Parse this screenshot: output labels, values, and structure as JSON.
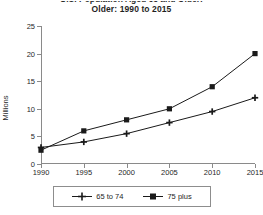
{
  "chart": {
    "title_line1": "U.S. Population Aged 65 and Older:",
    "title_line2": "Older:  1990 to 2015",
    "ylabel": "Millions",
    "xlabel": ""
  },
  "legend": {
    "items": [
      {
        "label": "65 to 74",
        "marker": "plus-marker",
        "color": "#1a1a1a"
      },
      {
        "label": "75 plus",
        "marker": "square-marker",
        "color": "#1a1a1a"
      }
    ]
  },
  "axes": {
    "y_ticks": [
      "0",
      "5",
      "10",
      "15",
      "20",
      "25"
    ],
    "x_ticks": [
      "1990",
      "1995",
      "2000",
      "2005",
      "2010",
      "2015"
    ]
  },
  "chart_data": {
    "type": "line",
    "title": "Older:  1990 to 2015",
    "xlabel": "",
    "ylabel": "Millions",
    "x": [
      1990,
      1995,
      2000,
      2005,
      2010,
      2015
    ],
    "xlim": [
      1990,
      2015
    ],
    "ylim": [
      0,
      25
    ],
    "ytick_values": [
      0,
      5,
      10,
      15,
      20,
      25
    ],
    "grid": false,
    "legend_position": "bottom",
    "series": [
      {
        "name": "65 to 74",
        "marker": "plus",
        "color": "#1a1a1a",
        "values": [
          3.0,
          4.0,
          5.5,
          7.5,
          9.5,
          12.0
        ]
      },
      {
        "name": "75 plus",
        "marker": "square",
        "color": "#1a1a1a",
        "values": [
          2.5,
          6.0,
          8.0,
          10.0,
          14.0,
          20.0
        ]
      }
    ]
  }
}
